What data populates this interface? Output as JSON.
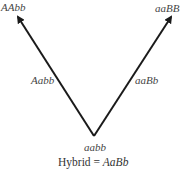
{
  "diagram": {
    "type": "cross-hybrid-pathway",
    "line_color": "#1a1a1a",
    "nodes": {
      "top_left": "AAbb",
      "top_right": "aaBB",
      "bottom": "aabb"
    },
    "edges": {
      "left": {
        "label": "Aabb",
        "from": "bottom",
        "to": "top_left"
      },
      "right": {
        "label": "aaBb",
        "from": "bottom",
        "to": "top_right"
      }
    },
    "caption": {
      "prefix": "Hybrid = ",
      "genotype": "AaBb"
    }
  }
}
